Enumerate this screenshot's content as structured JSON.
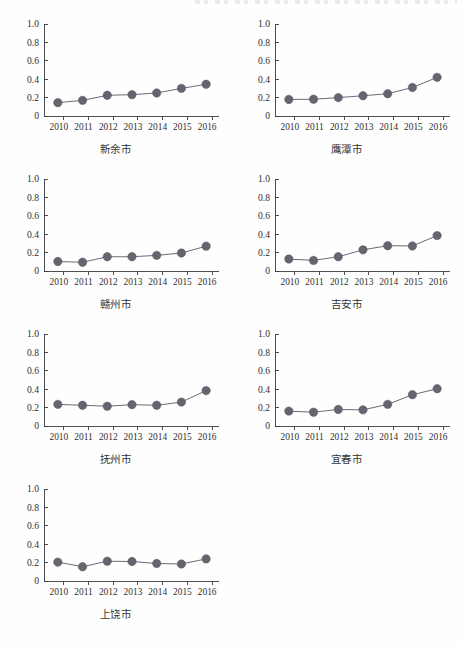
{
  "figure": {
    "panel_count": 7,
    "colors": {
      "marker": "#63656f",
      "line": "#6a6c76",
      "axis": "#3d3d3d",
      "background": "#fefefe",
      "text": "#2f2f2f"
    },
    "y_ticks": [
      "1.0",
      "0.8",
      "0.6",
      "0.4",
      "0.2",
      "0"
    ],
    "x_ticks": [
      "2010",
      "2011",
      "2012",
      "2013",
      "2014",
      "2015",
      "2016"
    ]
  },
  "chart_data": [
    {
      "type": "line",
      "title": "新余市",
      "xlabel": "",
      "ylabel": "",
      "categories": [
        "2010",
        "2011",
        "2012",
        "2013",
        "2014",
        "2015",
        "2016"
      ],
      "values": [
        0.145,
        0.17,
        0.225,
        0.232,
        0.25,
        0.3,
        0.345
      ],
      "ylim": [
        0,
        1.0
      ],
      "ytick_values": [
        0,
        0.2,
        0.4,
        0.6,
        0.8,
        1.0
      ],
      "grid": false,
      "legend": "none",
      "marker": "circle"
    },
    {
      "type": "line",
      "title": "鹰潭市",
      "xlabel": "",
      "ylabel": "",
      "categories": [
        "2010",
        "2011",
        "2012",
        "2013",
        "2014",
        "2015",
        "2016"
      ],
      "values": [
        0.18,
        0.182,
        0.2,
        0.22,
        0.242,
        0.31,
        0.42
      ],
      "ylim": [
        0,
        1.0
      ],
      "ytick_values": [
        0,
        0.2,
        0.4,
        0.6,
        0.8,
        1.0
      ],
      "grid": false,
      "legend": "none",
      "marker": "circle"
    },
    {
      "type": "line",
      "title": "赣州市",
      "xlabel": "",
      "ylabel": "",
      "categories": [
        "2010",
        "2011",
        "2012",
        "2013",
        "2014",
        "2015",
        "2016"
      ],
      "values": [
        0.103,
        0.095,
        0.155,
        0.155,
        0.17,
        0.195,
        0.27
      ],
      "ylim": [
        0,
        1.0
      ],
      "ytick_values": [
        0,
        0.2,
        0.4,
        0.6,
        0.8,
        1.0
      ],
      "grid": false,
      "legend": "none",
      "marker": "circle"
    },
    {
      "type": "line",
      "title": "吉安市",
      "xlabel": "",
      "ylabel": "",
      "categories": [
        "2010",
        "2011",
        "2012",
        "2013",
        "2014",
        "2015",
        "2016"
      ],
      "values": [
        0.13,
        0.115,
        0.155,
        0.23,
        0.275,
        0.272,
        0.385
      ],
      "ylim": [
        0,
        1.0
      ],
      "ytick_values": [
        0,
        0.2,
        0.4,
        0.6,
        0.8,
        1.0
      ],
      "grid": false,
      "legend": "none",
      "marker": "circle"
    },
    {
      "type": "line",
      "title": "抚州市",
      "xlabel": "",
      "ylabel": "",
      "categories": [
        "2010",
        "2011",
        "2012",
        "2013",
        "2014",
        "2015",
        "2016"
      ],
      "values": [
        0.235,
        0.225,
        0.215,
        0.232,
        0.225,
        0.26,
        0.385
      ],
      "ylim": [
        0,
        1.0
      ],
      "ytick_values": [
        0,
        0.2,
        0.4,
        0.6,
        0.8,
        1.0
      ],
      "grid": false,
      "legend": "none",
      "marker": "circle"
    },
    {
      "type": "line",
      "title": "宜春市",
      "xlabel": "",
      "ylabel": "",
      "categories": [
        "2010",
        "2011",
        "2012",
        "2013",
        "2014",
        "2015",
        "2016"
      ],
      "values": [
        0.162,
        0.15,
        0.18,
        0.175,
        0.235,
        0.34,
        0.405
      ],
      "ylim": [
        0,
        1.0
      ],
      "ytick_values": [
        0,
        0.2,
        0.4,
        0.6,
        0.8,
        1.0
      ],
      "grid": false,
      "legend": "none",
      "marker": "circle"
    },
    {
      "type": "line",
      "title": "上饶市",
      "xlabel": "",
      "ylabel": "",
      "categories": [
        "2010",
        "2011",
        "2012",
        "2013",
        "2014",
        "2015",
        "2016"
      ],
      "values": [
        0.205,
        0.155,
        0.215,
        0.212,
        0.19,
        0.185,
        0.24
      ],
      "ylim": [
        0,
        1.0
      ],
      "ytick_values": [
        0,
        0.2,
        0.4,
        0.6,
        0.8,
        1.0
      ],
      "grid": false,
      "legend": "none",
      "marker": "circle"
    }
  ]
}
